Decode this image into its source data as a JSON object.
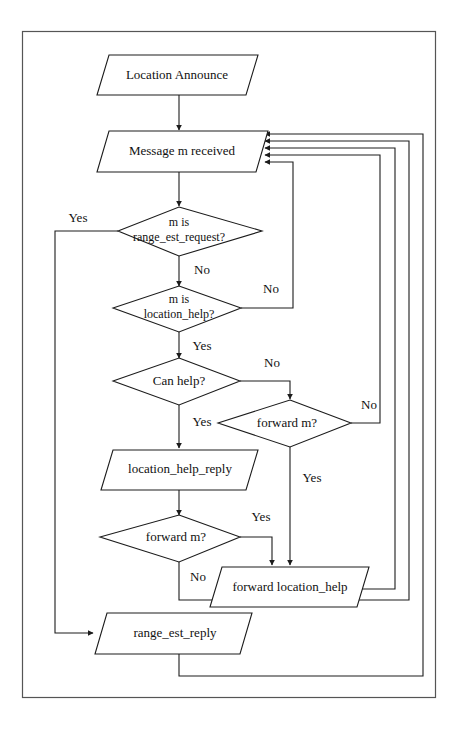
{
  "figure": {
    "type": "flowchart",
    "width": 461,
    "height": 734,
    "colors": {
      "background": "#ffffff",
      "stroke": "#1c1c1c",
      "frame": "#555555",
      "text": "#111111"
    }
  },
  "nodes": {
    "location_announce": {
      "label": "Location Announce",
      "shape": "parallelogram"
    },
    "message_received": {
      "label": "Message m received",
      "shape": "parallelogram"
    },
    "is_range_est_request": {
      "label_line1": "m is",
      "label_line2": "range_est_request?",
      "shape": "diamond"
    },
    "is_location_help": {
      "label_line1": "m is",
      "label_line2": "location_help?",
      "shape": "diamond"
    },
    "can_help": {
      "label": "Can help?",
      "shape": "diamond"
    },
    "forward_m_upper": {
      "label": "forward m?",
      "shape": "diamond"
    },
    "location_help_reply": {
      "label": "location_help_reply",
      "shape": "parallelogram"
    },
    "forward_m_lower": {
      "label": "forward m?",
      "shape": "diamond"
    },
    "forward_location_help": {
      "label": "forward location_help",
      "shape": "parallelogram"
    },
    "range_est_reply": {
      "label": "range_est_reply",
      "shape": "parallelogram"
    }
  },
  "edge_labels": {
    "range_est_request_yes": "Yes",
    "range_est_request_no": "No",
    "location_help_no": "No",
    "location_help_yes": "Yes",
    "can_help_no": "No",
    "can_help_yes": "Yes",
    "forward_m_upper_no": "No",
    "forward_m_upper_yes": "Yes",
    "forward_m_lower_yes": "Yes",
    "forward_m_lower_no": "No"
  }
}
